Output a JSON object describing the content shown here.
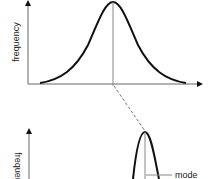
{
  "diagram": {
    "type": "distribution-comparison",
    "colors": {
      "curve": "#111111",
      "axis": "#555555",
      "guide": "#777777",
      "background": "#ffffff"
    },
    "top_panel": {
      "ylabel": "frequency",
      "curve": "normal (wide)",
      "center_line": true
    },
    "connector": {
      "style": "dashed",
      "from": "top-panel-center",
      "to": "bottom-panel-peak"
    },
    "bottom_panel": {
      "ylabel": "frequency",
      "curve": "normal (narrow)",
      "center_line": true,
      "annotation": "mode"
    }
  }
}
